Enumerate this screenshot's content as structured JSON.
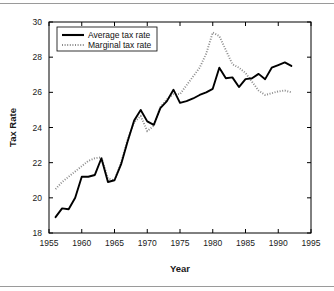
{
  "chart_data": {
    "type": "line",
    "title": "",
    "xlabel": "Year",
    "ylabel": "Tax Rate",
    "xlim": [
      1955,
      1995
    ],
    "ylim": [
      18,
      30
    ],
    "xticks": [
      1955,
      1960,
      1965,
      1970,
      1975,
      1980,
      1985,
      1990,
      1995
    ],
    "yticks": [
      18,
      20,
      22,
      24,
      26,
      28,
      30
    ],
    "grid": false,
    "legend_position": "top-left",
    "x": [
      1956,
      1957,
      1958,
      1959,
      1960,
      1961,
      1962,
      1963,
      1964,
      1965,
      1966,
      1967,
      1968,
      1969,
      1970,
      1971,
      1972,
      1973,
      1974,
      1975,
      1976,
      1977,
      1978,
      1979,
      1980,
      1981,
      1982,
      1983,
      1984,
      1985,
      1986,
      1987,
      1988,
      1989,
      1990,
      1991,
      1992
    ],
    "series": [
      {
        "name": "Average tax rate",
        "style": "solid",
        "color": "#000000",
        "values": [
          18.9,
          19.4,
          19.35,
          20.0,
          21.2,
          21.2,
          21.3,
          22.25,
          20.9,
          21.0,
          21.9,
          23.2,
          24.4,
          25.0,
          24.35,
          24.15,
          25.1,
          25.5,
          26.15,
          25.4,
          25.5,
          25.65,
          25.85,
          26.0,
          26.2,
          27.4,
          26.8,
          26.85,
          26.3,
          26.75,
          26.8,
          27.05,
          26.75,
          27.4,
          27.55,
          27.7,
          27.5
        ]
      },
      {
        "name": "Marginal tax rate",
        "style": "dotted",
        "color": "#8c8c8c",
        "values": [
          20.5,
          20.9,
          21.2,
          21.5,
          21.8,
          22.1,
          22.25,
          22.3,
          21.1,
          21.0,
          22.0,
          23.3,
          24.3,
          24.65,
          23.8,
          24.1,
          25.15,
          25.6,
          25.9,
          25.9,
          26.4,
          26.9,
          27.4,
          28.2,
          29.4,
          29.2,
          28.4,
          27.6,
          27.4,
          27.1,
          26.6,
          26.1,
          25.85,
          25.95,
          26.05,
          26.1,
          26.0
        ]
      }
    ]
  },
  "legend": {
    "entries": [
      {
        "label": "Average tax rate"
      },
      {
        "label": "Marginal tax rate"
      }
    ]
  },
  "axes": {
    "x_title": "Year",
    "y_title": "Tax Rate"
  }
}
